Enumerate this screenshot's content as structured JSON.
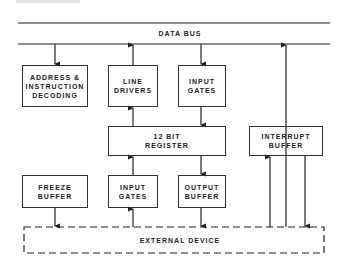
{
  "diagram": {
    "bus": {
      "label": "DATA BUS"
    },
    "blocks": {
      "address_decoding": {
        "line1": "ADDRESS &",
        "line2": "INSTRUCTION",
        "line3": "DECODING"
      },
      "line_drivers": {
        "line1": "LINE",
        "line2": "DRIVERS"
      },
      "input_gates_top": {
        "line1": "INPUT",
        "line2": "GATES"
      },
      "register": {
        "line1": "12 BIT",
        "line2": "REGISTER"
      },
      "interrupt_buffer": {
        "line1": "INTERRUPT",
        "line2": "BUFFER"
      },
      "freeze_buffer": {
        "line1": "FREEZE",
        "line2": "BUFFER"
      },
      "input_gates_bottom": {
        "line1": "INPUT",
        "line2": "GATES"
      },
      "output_buffer": {
        "line1": "OUTPUT",
        "line2": "BUFFER"
      },
      "external_device": {
        "label": "EXTERNAL DEVICE"
      }
    },
    "connections": [
      {
        "from": "data_bus",
        "to": "address_decoding"
      },
      {
        "from": "line_drivers",
        "to": "data_bus"
      },
      {
        "from": "data_bus",
        "to": "input_gates_top"
      },
      {
        "from": "external_device",
        "to": "data_bus",
        "via": "right bus line"
      },
      {
        "from": "register",
        "to": "line_drivers"
      },
      {
        "from": "input_gates_top",
        "to": "register"
      },
      {
        "from": "input_gates_bottom",
        "to": "register"
      },
      {
        "from": "register",
        "to": "output_buffer"
      },
      {
        "from": "external_device",
        "to": "interrupt_buffer"
      },
      {
        "from": "interrupt_buffer",
        "to": "external_device"
      },
      {
        "from": "freeze_buffer",
        "to": "external_device"
      },
      {
        "from": "external_device",
        "to": "input_gates_bottom"
      },
      {
        "from": "output_buffer",
        "to": "external_device"
      }
    ]
  }
}
